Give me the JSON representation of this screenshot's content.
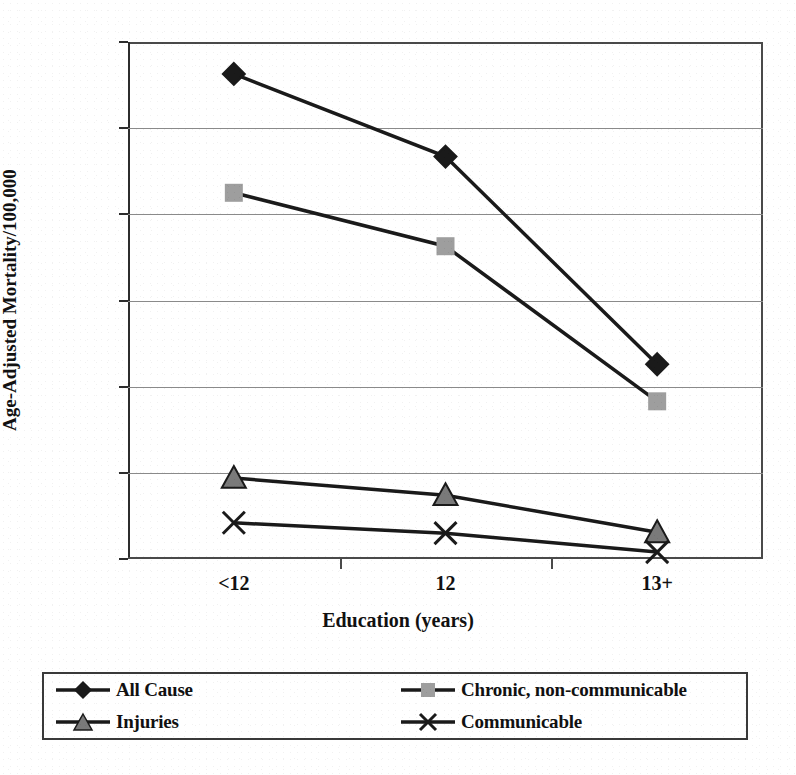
{
  "figure": {
    "title_partial": "",
    "background_color": "#ffffff",
    "ink_color": "#111111"
  },
  "chart_data": {
    "type": "line",
    "title": "",
    "xlabel": "Education (years)",
    "ylabel": "Age-Adjusted Mortality/100,000",
    "categories": [
      "<12",
      "12",
      "13+"
    ],
    "ylim": [
      0,
      600
    ],
    "ytick_labels": [
      "0",
      "100",
      "200",
      "300",
      "400",
      "500",
      "600"
    ],
    "ytick_values": [
      0,
      100,
      200,
      300,
      400,
      500,
      600
    ],
    "grid": true,
    "grid_axis": "y",
    "legend_position": "bottom",
    "series": [
      {
        "name": "All Cause",
        "marker": "diamond",
        "marker_color": "#1a1a1a",
        "line_color": "#1a1a1a",
        "values": [
          563,
          467,
          226
        ]
      },
      {
        "name": "Chronic, non-communicable",
        "marker": "square",
        "marker_color": "#9e9e9e",
        "line_color": "#1a1a1a",
        "values": [
          425,
          363,
          183
        ]
      },
      {
        "name": "Injuries",
        "marker": "triangle",
        "marker_color": "#7a7a7a",
        "line_color": "#1a1a1a",
        "values": [
          94,
          74,
          31
        ]
      },
      {
        "name": "Communicable",
        "marker": "x",
        "marker_color": "#1a1a1a",
        "line_color": "#1a1a1a",
        "values": [
          42,
          30,
          8
        ]
      }
    ]
  },
  "legend": {
    "entries": [
      {
        "label": "All Cause",
        "marker": "diamond"
      },
      {
        "label": "Chronic, non-communicable",
        "marker": "square"
      },
      {
        "label": "Injuries",
        "marker": "triangle"
      },
      {
        "label": "Communicable",
        "marker": "x"
      }
    ]
  }
}
